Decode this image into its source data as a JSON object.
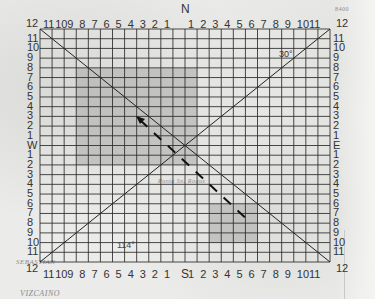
{
  "map": {
    "compass": {
      "north": "N",
      "south": "S",
      "east": "E",
      "west": "W"
    },
    "top_labels": [
      "12",
      "11",
      "10",
      "9",
      "8",
      "7",
      "6",
      "5",
      "4",
      "3",
      "2",
      "1",
      "",
      "1",
      "2",
      "3",
      "4",
      "5",
      "6",
      "7",
      "8",
      "9",
      "10",
      "11",
      "12"
    ],
    "bottom_labels": [
      "12",
      "11",
      "10",
      "9",
      "8",
      "7",
      "6",
      "5",
      "4",
      "3",
      "2",
      "1",
      "",
      "1",
      "2",
      "3",
      "4",
      "5",
      "6",
      "7",
      "8",
      "9",
      "10",
      "11",
      "12"
    ],
    "left_labels": [
      "12",
      "11",
      "10",
      "9",
      "8",
      "7",
      "6",
      "5",
      "4",
      "3",
      "2",
      "1",
      "W",
      "1",
      "2",
      "3",
      "4",
      "5",
      "6",
      "7",
      "8",
      "9",
      "10",
      "11",
      "12"
    ],
    "right_labels": [
      "12",
      "11",
      "10",
      "9",
      "8",
      "7",
      "6",
      "5",
      "4",
      "3",
      "2",
      "1",
      "E",
      "1",
      "2",
      "3",
      "4",
      "5",
      "6",
      "7",
      "8",
      "9",
      "10",
      "11",
      "12"
    ],
    "annotations": {
      "angle_upper_right": "30°",
      "angle_lower_left": "114°",
      "place_vizcaino": "VIZCAINO",
      "place_top_right": "8400",
      "place_sebastian": "SEBASTIAN",
      "place_center": "Punta Sn. Roque"
    },
    "grid": {
      "cols": 24,
      "rows": 24
    },
    "colors": {
      "grid_line": "#2b2b2b",
      "shaded_box": "#a9a9a9",
      "diagonal": "#222222",
      "dash_path": "#111111"
    }
  }
}
